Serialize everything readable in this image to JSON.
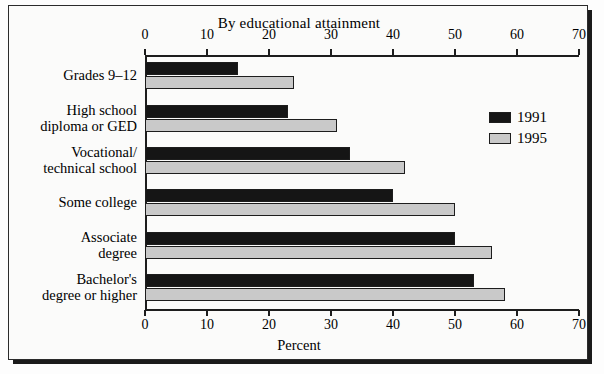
{
  "chart_data": {
    "type": "bar",
    "orientation": "horizontal",
    "title": "By educational attainment",
    "xlabel": "Percent",
    "ylabel": "",
    "xlim": [
      0,
      70
    ],
    "xticks": [
      0,
      10,
      20,
      30,
      40,
      50,
      60,
      70
    ],
    "xticklabels": [
      "0",
      "10",
      "20",
      "30",
      "40",
      "50",
      "60",
      "70"
    ],
    "grid": false,
    "legend_position": "upper right",
    "categories": [
      "Grades 9–12",
      "High school\ndiploma or GED",
      "Vocational/\ntechnical school",
      "Some college",
      "Associate\ndegree",
      "Bachelor's\ndegree or higher"
    ],
    "category_lines": [
      [
        "Grades 9–12"
      ],
      [
        "High school",
        "diploma or GED"
      ],
      [
        "Vocational/",
        "technical school"
      ],
      [
        "Some college"
      ],
      [
        "Associate",
        "degree"
      ],
      [
        "Bachelor's",
        "degree or higher"
      ]
    ],
    "series": [
      {
        "name": "1991",
        "color": "#151515",
        "values": [
          15,
          23,
          33,
          40,
          50,
          53
        ]
      },
      {
        "name": "1995",
        "color": "#c9c9c9",
        "values": [
          24,
          31,
          42,
          50,
          56,
          58
        ]
      }
    ],
    "axes_top": true,
    "axes_bottom": true
  }
}
